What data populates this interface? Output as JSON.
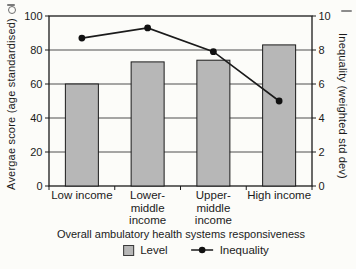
{
  "chart_data": {
    "type": "combo-bar-line",
    "categories": [
      "Low income",
      "Lower-middle income",
      "Upper-middle income",
      "High income"
    ],
    "categories_display": [
      "Low income",
      "Lower-\nmiddle\nincome",
      "Upper-\nmiddle\nincome",
      "High income"
    ],
    "series": [
      {
        "name": "Level",
        "type": "bar",
        "axis": "left",
        "values": [
          60,
          73,
          74,
          83
        ]
      },
      {
        "name": "Inequality",
        "type": "line",
        "axis": "right",
        "values": [
          8.7,
          9.3,
          7.9,
          5.0
        ]
      }
    ],
    "axes": {
      "left": {
        "label": "Avergae score (age standardised)",
        "range": [
          0,
          100
        ],
        "ticks": [
          0,
          20,
          40,
          60,
          80,
          100
        ]
      },
      "right": {
        "label": "Inequality (weighted std dev)",
        "range": [
          0,
          10
        ],
        "ticks": [
          0,
          2,
          4,
          6,
          8,
          10
        ]
      }
    },
    "xlabel": "Overall ambulatory health systems responsiveness",
    "grid": true,
    "legend_position": "bottom"
  },
  "colors": {
    "bar_fill": "#b7b7b7",
    "bar_border": "#1b1b1b",
    "line": "#1b1b1b",
    "marker": "#111111",
    "grid": "#4f4f4f",
    "axis": "#1b1b1b",
    "text": "#1b1b1b",
    "background": "#fcfcf9"
  }
}
